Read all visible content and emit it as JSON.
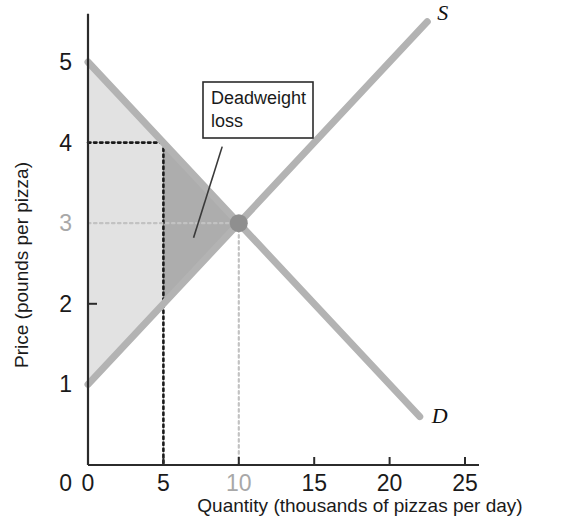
{
  "chart_data": {
    "type": "line",
    "title": "",
    "xlabel": "Quantity (thousands of pizzas per day)",
    "ylabel": "Price (pounds per pizza)",
    "xlim": [
      0,
      25
    ],
    "ylim": [
      0,
      5.6
    ],
    "grid": false,
    "legend_position": "inline-curve-labels",
    "x_ticks": [
      {
        "value": 0,
        "label": "0",
        "muted": false
      },
      {
        "value": 5,
        "label": "5",
        "muted": false
      },
      {
        "value": 10,
        "label": "10",
        "muted": true
      },
      {
        "value": 15,
        "label": "15",
        "muted": false
      },
      {
        "value": 20,
        "label": "20",
        "muted": false
      },
      {
        "value": 25,
        "label": "25",
        "muted": false
      }
    ],
    "y_ticks": [
      {
        "value": 0,
        "label": "0",
        "muted": false
      },
      {
        "value": 1,
        "label": "1",
        "muted": false
      },
      {
        "value": 2,
        "label": "2",
        "muted": false
      },
      {
        "value": 3,
        "label": "3",
        "muted": true
      },
      {
        "value": 4,
        "label": "4",
        "muted": false
      },
      {
        "value": 5,
        "label": "5",
        "muted": false
      }
    ],
    "series": [
      {
        "name": "Demand",
        "label": "D",
        "color": "#b3b3b3",
        "points": [
          [
            0,
            5.0
          ],
          [
            22.0,
            0.6
          ]
        ]
      },
      {
        "name": "Supply",
        "label": "S",
        "color": "#b3b3b3",
        "points": [
          [
            0,
            1.0
          ],
          [
            22.5,
            5.5
          ]
        ]
      }
    ],
    "equilibrium": {
      "q": 10,
      "p": 3,
      "color": "#8f8f8f"
    },
    "regions": [
      {
        "name": "surplus-left-of-quota",
        "fill": "#e2e2e2",
        "polygon": [
          [
            0,
            5
          ],
          [
            5,
            4
          ],
          [
            5,
            2
          ],
          [
            0,
            1
          ]
        ]
      },
      {
        "name": "deadweight-loss",
        "fill": "#adadad",
        "polygon": [
          [
            5,
            4
          ],
          [
            10,
            3
          ],
          [
            5,
            2
          ]
        ]
      }
    ],
    "guide_lines": [
      {
        "name": "price-4-horizontal",
        "from": [
          0,
          4
        ],
        "to": [
          5,
          4
        ],
        "style": "dotted",
        "color": "#1a1a1a"
      },
      {
        "name": "quantity-5-vertical",
        "from": [
          5,
          4
        ],
        "to": [
          5,
          0
        ],
        "style": "dotted",
        "color": "#1a1a1a"
      },
      {
        "name": "price-3-horizontal",
        "from": [
          0,
          3
        ],
        "to": [
          10,
          3
        ],
        "style": "dotted",
        "color": "#c2c2c2"
      },
      {
        "name": "quantity-10-vertical",
        "from": [
          10,
          3
        ],
        "to": [
          10,
          0
        ],
        "style": "dotted",
        "color": "#c2c2c2"
      }
    ],
    "annotations": [
      {
        "name": "deadweight-loss-callout",
        "line1": "Deadweight",
        "line2": "loss",
        "leader_from": [
          7.0,
          2.82
        ],
        "leader_to": [
          8.9,
          3.95
        ]
      }
    ]
  },
  "colors": {
    "axis": "#2b2b2b",
    "curve": "#b3b3b3",
    "tick_text": "#1a1a1a",
    "tick_text_muted": "#a8a8a8",
    "region_light": "#e2e2e2",
    "region_dark": "#adadad",
    "equilibrium_dot": "#8f8f8f",
    "background": "#ffffff"
  }
}
